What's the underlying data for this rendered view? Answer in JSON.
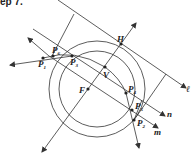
{
  "header": {
    "text": "ep 7."
  },
  "diagram": {
    "colors": {
      "stroke": "#333333",
      "background": "#ffffff"
    },
    "points": {
      "H": {
        "label": "H",
        "x": 121,
        "y": 44
      },
      "V": {
        "label": "V",
        "x": 105,
        "y": 67
      },
      "F": {
        "label": "F",
        "x": 88,
        "y": 89
      },
      "P1": {
        "label": "P",
        "sub": "1",
        "x": 43,
        "y": 58
      },
      "P6": {
        "label": "P",
        "sub": "6",
        "x": 53,
        "y": 56
      },
      "P3": {
        "label": "P",
        "sub": "3",
        "x": 72,
        "y": 56
      },
      "P4": {
        "label": "P",
        "sub": "4",
        "x": 126,
        "y": 93
      },
      "P5": {
        "label": "P",
        "sub": "5",
        "x": 132,
        "y": 110
      },
      "P2": {
        "label": "P",
        "sub": "2",
        "x": 134,
        "y": 120
      }
    },
    "lines": {
      "l": {
        "label": "ℓ"
      },
      "n": {
        "label": "n"
      },
      "m": {
        "label": "m"
      }
    }
  }
}
